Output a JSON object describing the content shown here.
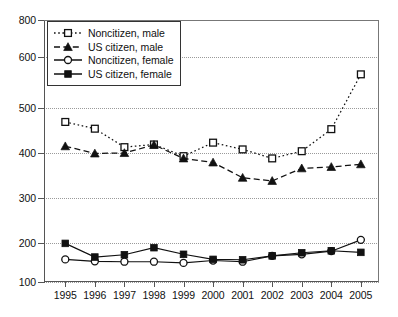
{
  "chart_data": {
    "type": "line",
    "title": "",
    "subtitle": "",
    "xlabel": "",
    "ylabel": "",
    "x": [
      1995,
      1996,
      1997,
      1998,
      1999,
      2000,
      2001,
      2002,
      2003,
      2004,
      2005
    ],
    "categories": [
      "1995",
      "1996",
      "1997",
      "1998",
      "1999",
      "2000",
      "2001",
      "2002",
      "2003",
      "2004",
      "2005"
    ],
    "xlim": [
      1995,
      2005
    ],
    "ylim": [
      100,
      800
    ],
    "yticks": [
      100,
      200,
      300,
      400,
      500,
      600,
      800
    ],
    "ytick_labels": [
      "100",
      "200",
      "300",
      "400",
      "500",
      "600",
      "800"
    ],
    "grid": true,
    "grid_axis": "y",
    "legend_position": "top-left",
    "series": [
      {
        "name": "Noncitizen, male",
        "marker": "open-square",
        "line_style": "dotted",
        "color": "#111111",
        "values": [
          469,
          454,
          413,
          419,
          393,
          423,
          408,
          388,
          404,
          453,
          566
        ]
      },
      {
        "name": "US citizen, male",
        "marker": "filled-triangle",
        "line_style": "dashed",
        "color": "#111111",
        "values": [
          415,
          399,
          400,
          418,
          388,
          379,
          345,
          338,
          366,
          369,
          375
        ]
      },
      {
        "name": "Noncitizen, female",
        "marker": "open-circle",
        "line_style": "solid",
        "color": "#111111",
        "values": [
          158,
          153,
          152,
          152,
          149,
          155,
          152,
          167,
          171,
          179,
          207
        ]
      },
      {
        "name": "US citizen, female",
        "marker": "filled-square",
        "line_style": "solid",
        "color": "#111111",
        "values": [
          199,
          164,
          170,
          188,
          171,
          158,
          157,
          167,
          175,
          180,
          176
        ]
      }
    ]
  },
  "legend": {
    "items": [
      {
        "label": "Noncitizen, male"
      },
      {
        "label": "US citizen, male"
      },
      {
        "label": "Noncitizen, female"
      },
      {
        "label": "US citizen, female"
      }
    ]
  }
}
